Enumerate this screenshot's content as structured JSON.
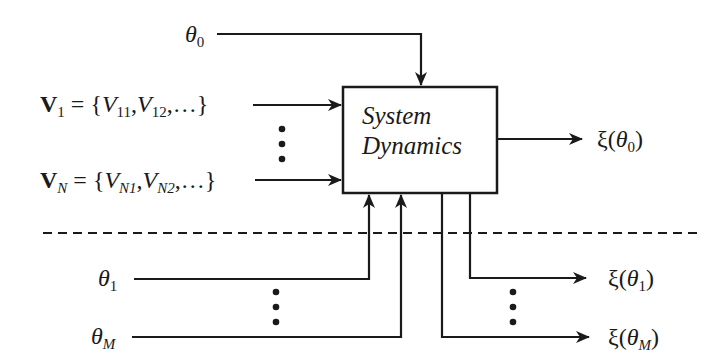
{
  "diagram": {
    "box": {
      "line1": "System",
      "line2": "Dynamics"
    },
    "inputs": {
      "theta0": {
        "sym": "θ",
        "sub": "0"
      },
      "v1": {
        "vec": "V",
        "vec_sub": "1",
        "eq": " = {",
        "e1": "V",
        "e1_sub": "11",
        "comma1": ",",
        "e2": "V",
        "e2_sub": "12",
        "tail": ",…}"
      },
      "vN": {
        "vec": "V",
        "vec_sub": "N",
        "eq": " = {",
        "e1": "V",
        "e1_sub": "N1",
        "comma1": ",",
        "e2": "V",
        "e2_sub": "N2",
        "tail": ",…}"
      },
      "theta1": {
        "sym": "θ",
        "sub": "1"
      },
      "thetaM": {
        "sym": "θ",
        "sub": "M"
      }
    },
    "outputs": {
      "xi0": {
        "xi": "ξ(",
        "sym": "θ",
        "sub": "0",
        "close": ")"
      },
      "xi1": {
        "xi": "ξ(",
        "sym": "θ",
        "sub": "1",
        "close": ")"
      },
      "xiM": {
        "xi": "ξ(",
        "sym": "θ",
        "sub": "M",
        "close": ")"
      }
    },
    "ellipsis": "⋮",
    "colors": {
      "stroke": "#1a1a1a",
      "background": "#ffffff"
    }
  }
}
